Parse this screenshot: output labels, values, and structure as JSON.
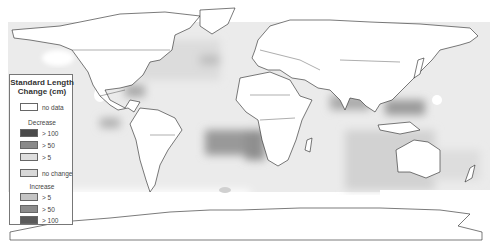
{
  "map": {
    "projection": "world-equirectangular",
    "background": "#ffffff",
    "ocean_no_change_color": "#e6e6e6",
    "land_color": "#ffffff",
    "border_color": "#222222"
  },
  "legend": {
    "title_line1": "Standard Length",
    "title_line2": "Change (cm)",
    "no_data": {
      "label": "no data",
      "color": "#ffffff"
    },
    "decrease": {
      "heading": "Decrease",
      "items": [
        {
          "label": "> 100",
          "color": "#4a4a4a"
        },
        {
          "label": "> 50",
          "color": "#8a8a8a"
        },
        {
          "label": "> 5",
          "color": "#dedede"
        }
      ]
    },
    "no_change": {
      "label": "no change",
      "color": "#d8d8d8"
    },
    "increase": {
      "heading": "Increase",
      "items": [
        {
          "label": "> 5",
          "color": "#c4c4c4"
        },
        {
          "label": "> 50",
          "color": "#8c8c8c"
        },
        {
          "label": "> 100",
          "color": "#5a5a5a"
        }
      ]
    }
  }
}
